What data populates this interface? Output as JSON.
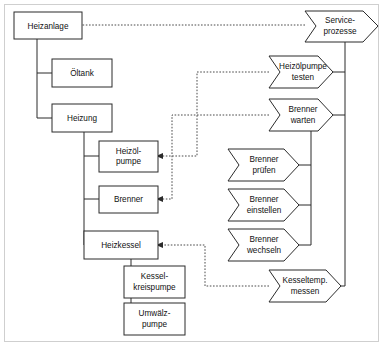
{
  "diagram": {
    "type": "hierarchy-with-process-links",
    "colors": {
      "node_stroke": "#2b2b2b",
      "node_fill": "#ffffff",
      "link": "#2b2b2b",
      "dashed_link": "#4a4a4a",
      "frame": "#cfcfcf",
      "text": "#111111"
    },
    "components": {
      "root": {
        "id": "heizanlage",
        "label": "Heizanlage"
      },
      "nodes": [
        {
          "id": "heizanlage",
          "label": "Heizanlage",
          "lines": [
            "Heizanlage"
          ]
        },
        {
          "id": "oeltank",
          "label": "Öltank",
          "lines": [
            "Öltank"
          ]
        },
        {
          "id": "heizung",
          "label": "Heizung",
          "lines": [
            "Heizung"
          ]
        },
        {
          "id": "heizoelpumpe",
          "label": "Heizölpumpe",
          "lines": [
            "Heizöl-",
            "pumpe"
          ]
        },
        {
          "id": "brenner",
          "label": "Brenner",
          "lines": [
            "Brenner"
          ]
        },
        {
          "id": "heizkessel",
          "label": "Heizkessel",
          "lines": [
            "Heizkessel"
          ]
        },
        {
          "id": "kesselkreispumpe",
          "label": "Kesselkreispumpe",
          "lines": [
            "Kessel-",
            "kreispumpe"
          ]
        },
        {
          "id": "umwaelzpumpe",
          "label": "Umwälzpumpe",
          "lines": [
            "Umwälz-",
            "pumpe"
          ]
        }
      ]
    },
    "processes": {
      "root": {
        "id": "serviceprozesse",
        "label": "Serviceprozesse"
      },
      "nodes": [
        {
          "id": "serviceprozesse",
          "label": "Serviceprozesse",
          "lines": [
            "Service-",
            "prozesse"
          ]
        },
        {
          "id": "heizoelpumpe-testen",
          "label": "Heizölpumpe testen",
          "lines": [
            "Heizölpumpe",
            "testen"
          ]
        },
        {
          "id": "brenner-warten",
          "label": "Brenner warten",
          "lines": [
            "Brenner",
            "warten"
          ]
        },
        {
          "id": "brenner-pruefen",
          "label": "Brenner prüfen",
          "lines": [
            "Brenner",
            "prüfen"
          ]
        },
        {
          "id": "brenner-einstellen",
          "label": "Brenner einstellen",
          "lines": [
            "Brenner",
            "einstellen"
          ]
        },
        {
          "id": "brenner-wechseln",
          "label": "Brenner wechseln",
          "lines": [
            "Brenner",
            "wechseln"
          ]
        },
        {
          "id": "kesseltemp-messen",
          "label": "Kesseltemp. messen",
          "lines": [
            "Kesseltemp.",
            "messen"
          ]
        }
      ]
    },
    "links": [
      {
        "from": "serviceprozesse",
        "to": "heizanlage",
        "style": "dashed"
      },
      {
        "from": "heizoelpumpe-testen",
        "to": "heizoelpumpe",
        "style": "dashed"
      },
      {
        "from": "brenner-warten",
        "to": "brenner",
        "style": "dashed"
      },
      {
        "from": "kesseltemp-messen",
        "to": "heizkessel",
        "style": "dashed"
      }
    ]
  }
}
